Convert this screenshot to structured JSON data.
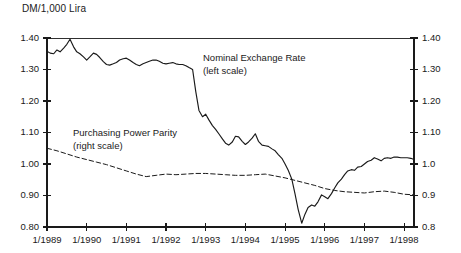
{
  "chart_data": {
    "type": "line",
    "title": "DM/1,000 Lira",
    "xlabel": "",
    "ylabel": "",
    "ylim": [
      0.8,
      1.4
    ],
    "xlim": [
      1989.0,
      1998.25
    ],
    "grid": false,
    "legend_position": "inline-annotations",
    "y_left_ticks": [
      "1.40",
      "1.30",
      "1.20",
      "1.10",
      "1.00",
      "0.90",
      "0.80"
    ],
    "y_left_tick_values": [
      1.4,
      1.3,
      1.2,
      1.1,
      1.0,
      0.9,
      0.8
    ],
    "y_right_ticks": [
      "1.40",
      "1.30",
      "1.20",
      "1.10",
      "1.0",
      "0.9",
      "0.8"
    ],
    "y_right_tick_values": [
      1.4,
      1.3,
      1.2,
      1.1,
      1.0,
      0.9,
      0.8
    ],
    "x_ticks": [
      "1/1989",
      "1/1990",
      "1/1991",
      "1/1992",
      "1/1993",
      "1/1994",
      "1/1995",
      "1/1996",
      "1/1997",
      "1/1998"
    ],
    "x_tick_values": [
      1989,
      1990,
      1991,
      1992,
      1993,
      1994,
      1995,
      1996,
      1997,
      1998
    ],
    "annotations": [
      {
        "name": "nominal-exchange-rate-annotation",
        "line1": "Nominal Exchange Rate",
        "line2": "(left scale)",
        "x_px": 203,
        "y_px": 52
      },
      {
        "name": "purchasing-power-parity-annotation",
        "line1": "Purchasing Power Parity",
        "line2": "(right scale)",
        "x_px": 73,
        "y_px": 127
      }
    ],
    "series": [
      {
        "name": "Nominal Exchange Rate",
        "scale": "left",
        "style": "solid",
        "color": "#1a1a1a",
        "x": [
          1989.0,
          1989.08,
          1989.17,
          1989.25,
          1989.33,
          1989.42,
          1989.5,
          1989.58,
          1989.67,
          1989.75,
          1989.83,
          1989.92,
          1990.0,
          1990.08,
          1990.17,
          1990.25,
          1990.33,
          1990.42,
          1990.5,
          1990.58,
          1990.67,
          1990.75,
          1990.83,
          1990.92,
          1991.0,
          1991.08,
          1991.17,
          1991.25,
          1991.33,
          1991.42,
          1991.5,
          1991.58,
          1991.67,
          1991.75,
          1991.83,
          1991.92,
          1992.0,
          1992.08,
          1992.17,
          1992.25,
          1992.33,
          1992.42,
          1992.5,
          1992.58,
          1992.67,
          1992.75,
          1992.83,
          1992.92,
          1993.0,
          1993.08,
          1993.17,
          1993.25,
          1993.33,
          1993.42,
          1993.5,
          1993.58,
          1993.67,
          1993.75,
          1993.83,
          1993.92,
          1994.0,
          1994.08,
          1994.17,
          1994.25,
          1994.33,
          1994.42,
          1994.5,
          1994.58,
          1994.67,
          1994.75,
          1994.83,
          1994.92,
          1995.0,
          1995.08,
          1995.17,
          1995.25,
          1995.33,
          1995.42,
          1995.5,
          1995.58,
          1995.67,
          1995.75,
          1995.83,
          1995.92,
          1996.0,
          1996.08,
          1996.17,
          1996.25,
          1996.33,
          1996.42,
          1996.5,
          1996.58,
          1996.67,
          1996.75,
          1996.83,
          1996.92,
          1997.0,
          1997.08,
          1997.17,
          1997.25,
          1997.33,
          1997.42,
          1997.5,
          1997.58,
          1997.67,
          1997.75,
          1997.83,
          1997.92,
          1998.0,
          1998.08,
          1998.17,
          1998.25
        ],
        "values": [
          1.358,
          1.352,
          1.35,
          1.362,
          1.356,
          1.368,
          1.38,
          1.396,
          1.372,
          1.356,
          1.35,
          1.34,
          1.33,
          1.34,
          1.352,
          1.348,
          1.338,
          1.325,
          1.316,
          1.314,
          1.318,
          1.322,
          1.33,
          1.334,
          1.336,
          1.33,
          1.322,
          1.316,
          1.312,
          1.318,
          1.322,
          1.326,
          1.33,
          1.33,
          1.326,
          1.32,
          1.318,
          1.32,
          1.322,
          1.318,
          1.316,
          1.316,
          1.312,
          1.306,
          1.3,
          1.23,
          1.17,
          1.15,
          1.158,
          1.14,
          1.122,
          1.11,
          1.096,
          1.08,
          1.066,
          1.06,
          1.07,
          1.088,
          1.086,
          1.072,
          1.062,
          1.07,
          1.082,
          1.096,
          1.072,
          1.06,
          1.058,
          1.056,
          1.048,
          1.042,
          1.03,
          1.018,
          1.0,
          0.98,
          0.952,
          0.906,
          0.856,
          0.812,
          0.84,
          0.862,
          0.87,
          0.866,
          0.88,
          0.902,
          0.896,
          0.89,
          0.906,
          0.924,
          0.94,
          0.952,
          0.966,
          0.978,
          0.982,
          0.98,
          0.99,
          0.992,
          1.0,
          1.008,
          1.012,
          1.02,
          1.016,
          1.01,
          1.018,
          1.02,
          1.018,
          1.022,
          1.022,
          1.02,
          1.02,
          1.02,
          1.018,
          1.014
        ]
      },
      {
        "name": "Purchasing Power Parity",
        "scale": "right",
        "style": "dashed",
        "color": "#1a1a1a",
        "x": [
          1989.0,
          1989.25,
          1989.5,
          1989.75,
          1990.0,
          1990.25,
          1990.5,
          1990.75,
          1991.0,
          1991.25,
          1991.5,
          1991.75,
          1992.0,
          1992.25,
          1992.5,
          1992.75,
          1993.0,
          1993.25,
          1993.5,
          1993.75,
          1994.0,
          1994.25,
          1994.5,
          1994.75,
          1995.0,
          1995.25,
          1995.5,
          1995.75,
          1996.0,
          1996.25,
          1996.5,
          1996.75,
          1997.0,
          1997.25,
          1997.5,
          1997.75,
          1998.0,
          1998.25
        ],
        "values": [
          1.05,
          1.042,
          1.032,
          1.022,
          1.014,
          1.006,
          0.998,
          0.988,
          0.978,
          0.968,
          0.96,
          0.964,
          0.968,
          0.966,
          0.968,
          0.97,
          0.97,
          0.968,
          0.966,
          0.964,
          0.964,
          0.966,
          0.968,
          0.962,
          0.956,
          0.948,
          0.94,
          0.932,
          0.922,
          0.916,
          0.912,
          0.91,
          0.908,
          0.912,
          0.914,
          0.91,
          0.904,
          0.902
        ]
      }
    ]
  },
  "plot_geometry": {
    "left_px": 47,
    "right_px": 414,
    "top_px": 38,
    "bottom_px": 227
  }
}
